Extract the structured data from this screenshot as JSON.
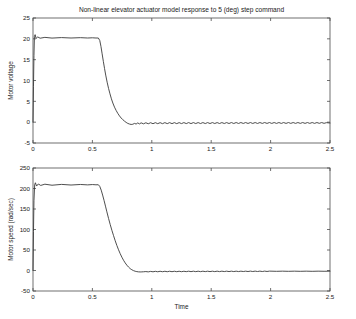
{
  "figure": {
    "title": "Non-linear elevator actuator model response to 5 (deg) step command",
    "background_color": "#ffffff",
    "line_color": "#3a3a3a",
    "axis_color": "#4d4d4d"
  },
  "chart_data": [
    {
      "type": "line",
      "id": "motor-voltage",
      "title": "Non-linear elevator actuator model response to 5 (deg) step command",
      "xlabel": "",
      "ylabel": "Motor voltage",
      "xlim": [
        0,
        2.5
      ],
      "ylim": [
        -5,
        25
      ],
      "xticks": [
        0,
        0.5,
        1,
        1.5,
        2,
        2.5
      ],
      "xticklabels": [
        "0",
        "0.5",
        "1",
        "1.5",
        "2",
        "2.5"
      ],
      "yticks": [
        -5,
        0,
        5,
        10,
        15,
        20,
        25
      ],
      "yticklabels": [
        "-5",
        "0",
        "5",
        "10",
        "15",
        "20",
        "25"
      ],
      "grid": false,
      "legend": null,
      "series": [
        {
          "name": "Motor voltage",
          "x": [
            0,
            0.004,
            0.008,
            0.012,
            0.018,
            0.026,
            0.04,
            0.06,
            0.1,
            0.16,
            0.24,
            0.32,
            0.4,
            0.46,
            0.5,
            0.53,
            0.55,
            0.562,
            0.572,
            0.582,
            0.592,
            0.602,
            0.612,
            0.624,
            0.636,
            0.648,
            0.66,
            0.672,
            0.686,
            0.7,
            0.714,
            0.728,
            0.742,
            0.756,
            0.77,
            0.784,
            0.798,
            0.812,
            0.826,
            0.84,
            0.854,
            0.868,
            0.882,
            0.896,
            0.91,
            0.93,
            0.95,
            0.97,
            0.99,
            1.01,
            1.03,
            1.05,
            1.07,
            1.09,
            1.11,
            1.13,
            1.15,
            1.17,
            1.19,
            1.21,
            1.23,
            1.25,
            1.27,
            1.29,
            1.31,
            1.33,
            1.35,
            1.37,
            1.39,
            1.41,
            1.43,
            1.45,
            1.47,
            1.49,
            1.51,
            1.53,
            1.55,
            1.57,
            1.59,
            1.61,
            1.63,
            1.65,
            1.67,
            1.69,
            1.71,
            1.73,
            1.75,
            1.77,
            1.79,
            1.81,
            1.83,
            1.85,
            1.87,
            1.89,
            1.91,
            1.93,
            1.95,
            1.97,
            1.99,
            2.01,
            2.03,
            2.05,
            2.07,
            2.09,
            2.11,
            2.13,
            2.15,
            2.17,
            2.19,
            2.21,
            2.23,
            2.25,
            2.27,
            2.29,
            2.31,
            2.33,
            2.35,
            2.37,
            2.39,
            2.41,
            2.43,
            2.45,
            2.47,
            2.5
          ],
          "y": [
            0,
            8.5,
            16.0,
            20.6,
            21.0,
            20.1,
            20.45,
            20.15,
            20.35,
            20.18,
            20.3,
            20.2,
            20.28,
            20.2,
            20.25,
            20.2,
            20.2,
            19.6,
            18.2,
            16.4,
            14.6,
            12.9,
            11.3,
            9.6,
            8.1,
            6.8,
            5.6,
            4.6,
            3.6,
            2.8,
            2.1,
            1.5,
            1.0,
            0.6,
            0.25,
            -0.05,
            -0.3,
            -0.45,
            -0.55,
            -0.5,
            -0.3,
            -0.45,
            -0.18,
            -0.42,
            -0.16,
            -0.4,
            -0.14,
            -0.38,
            -0.13,
            -0.37,
            -0.12,
            -0.36,
            -0.12,
            -0.36,
            -0.11,
            -0.35,
            -0.11,
            -0.35,
            -0.11,
            -0.35,
            -0.11,
            -0.34,
            -0.1,
            -0.34,
            -0.1,
            -0.34,
            -0.1,
            -0.33,
            -0.1,
            -0.33,
            -0.1,
            -0.33,
            -0.1,
            -0.33,
            -0.1,
            -0.32,
            -0.1,
            -0.32,
            -0.1,
            -0.32,
            -0.1,
            -0.32,
            -0.09,
            -0.32,
            -0.09,
            -0.31,
            -0.09,
            -0.31,
            -0.09,
            -0.31,
            -0.09,
            -0.31,
            -0.09,
            -0.31,
            -0.09,
            -0.3,
            -0.09,
            -0.3,
            -0.09,
            -0.3,
            -0.09,
            -0.3,
            -0.09,
            -0.3,
            -0.09,
            -0.3,
            -0.09,
            -0.29,
            -0.09,
            -0.29,
            -0.09,
            -0.29,
            -0.09,
            -0.29,
            -0.09,
            -0.29,
            -0.09,
            -0.29,
            -0.09,
            -0.28,
            -0.09,
            -0.28,
            -0.12,
            -0.2
          ]
        }
      ]
    },
    {
      "type": "line",
      "id": "motor-speed",
      "title": "",
      "xlabel": "Time",
      "ylabel": "Motor speed (rad/sec)",
      "xlim": [
        0,
        2.5
      ],
      "ylim": [
        -50,
        250
      ],
      "xticks": [
        0,
        0.5,
        1,
        1.5,
        2,
        2.5
      ],
      "xticklabels": [
        "0",
        "0.5",
        "1",
        "1.5",
        "2",
        "2.5"
      ],
      "yticks": [
        -50,
        0,
        50,
        100,
        150,
        200,
        250
      ],
      "yticklabels": [
        "-50",
        "0",
        "50",
        "100",
        "150",
        "200",
        "250"
      ],
      "grid": false,
      "legend": null,
      "series": [
        {
          "name": "Motor speed (rad/sec)",
          "x": [
            0,
            0.004,
            0.008,
            0.014,
            0.02,
            0.03,
            0.045,
            0.065,
            0.1,
            0.16,
            0.24,
            0.32,
            0.4,
            0.46,
            0.5,
            0.53,
            0.55,
            0.562,
            0.574,
            0.586,
            0.598,
            0.61,
            0.622,
            0.636,
            0.65,
            0.664,
            0.678,
            0.692,
            0.706,
            0.72,
            0.734,
            0.748,
            0.762,
            0.776,
            0.79,
            0.804,
            0.818,
            0.832,
            0.846,
            0.86,
            0.874,
            0.888,
            0.902,
            0.916,
            0.93,
            0.95,
            0.97,
            0.99,
            1.01,
            1.03,
            1.05,
            1.07,
            1.09,
            1.11,
            1.13,
            1.15,
            1.17,
            1.19,
            1.21,
            1.23,
            1.25,
            1.27,
            1.29,
            1.31,
            1.33,
            1.35,
            1.37,
            1.39,
            1.41,
            1.43,
            1.45,
            1.47,
            1.49,
            1.51,
            1.53,
            1.55,
            1.57,
            1.59,
            1.61,
            1.63,
            1.65,
            1.67,
            1.69,
            1.71,
            1.73,
            1.75,
            1.77,
            1.79,
            1.81,
            1.83,
            1.85,
            1.87,
            1.89,
            1.91,
            1.93,
            1.95,
            1.97,
            1.99,
            2.05,
            2.1,
            2.15,
            2.2,
            2.25,
            2.3,
            2.35,
            2.4,
            2.45,
            2.5
          ],
          "y": [
            0,
            95,
            170,
            209,
            214,
            206,
            211,
            207.5,
            210.5,
            208,
            210,
            208.5,
            209.8,
            208.8,
            209.6,
            209,
            209.2,
            205,
            196,
            184,
            171,
            157,
            143,
            127,
            112,
            98,
            85,
            72.5,
            61,
            50.5,
            41,
            32.5,
            25,
            18.5,
            13,
            8.4,
            4.6,
            1.8,
            -0.3,
            -1.8,
            -2.7,
            -3.3,
            -3.5,
            -3.4,
            -3.1,
            -2.6,
            -3.4,
            -2.2,
            -3.2,
            -2.0,
            -3.1,
            -1.9,
            -3.0,
            -1.9,
            -3.0,
            -1.8,
            -2.9,
            -1.8,
            -2.9,
            -1.8,
            -2.9,
            -1.8,
            -2.8,
            -1.7,
            -2.8,
            -1.7,
            -2.8,
            -1.7,
            -2.8,
            -1.7,
            -2.7,
            -1.7,
            -2.7,
            -1.7,
            -2.7,
            -1.6,
            -2.7,
            -1.6,
            -2.6,
            -1.6,
            -2.6,
            -1.6,
            -2.6,
            -1.6,
            -2.6,
            -1.6,
            -2.5,
            -1.6,
            -2.5,
            -1.5,
            -2.5,
            -1.5,
            -2.5,
            -1.5,
            -2.5,
            -1.5,
            -2.4,
            -1.5,
            -2.0,
            -1.6,
            -2.0,
            -1.6,
            -2.0,
            -1.6,
            -2.0,
            -1.6,
            -1.9,
            -1.7
          ]
        }
      ]
    }
  ]
}
